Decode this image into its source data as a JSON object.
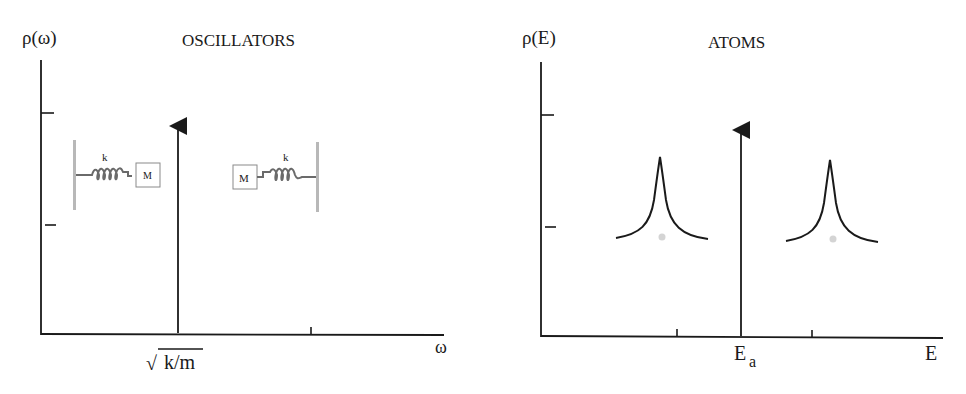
{
  "panels": [
    {
      "id": "oscillators",
      "title": "OSCILLATORS",
      "y_label": "ρ(ω)",
      "x_label": "ω",
      "peak_label": "k/m",
      "peak_label_prefix": "√",
      "spring_label": "k",
      "mass_label": "M"
    },
    {
      "id": "atoms",
      "title": "ATOMS",
      "y_label": "ρ(E)",
      "x_label": "E",
      "peak_label_main": "E",
      "peak_label_sub": "a"
    }
  ],
  "colors": {
    "ink": "#1a1a1a",
    "wall": "#b8b8b8",
    "spring": "#6a6a6a",
    "dot": "#d4d4d4"
  }
}
